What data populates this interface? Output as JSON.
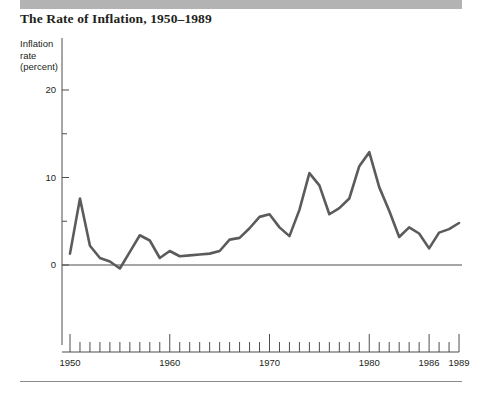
{
  "figure": {
    "title": "The Rate of Inflation, 1950–1989",
    "y_axis_caption_line1": "Inflation",
    "y_axis_caption_line2": "rate",
    "y_axis_caption_line3": "(percent)",
    "line_color": "#5b5b5b",
    "axis_color": "#4d4d4d",
    "band_color": "#b3b3b3",
    "text_color": "#231f20"
  },
  "chart_data": {
    "type": "line",
    "title": "The Rate of Inflation, 1950–1989",
    "xlabel": "",
    "ylabel": "Inflation rate (percent)",
    "xlim": [
      1949,
      1990
    ],
    "ylim": [
      -6,
      23
    ],
    "grid": false,
    "legend": null,
    "y_major_ticks": [
      0,
      10,
      20
    ],
    "y_minor_ticks": [
      5,
      15
    ],
    "y_tick_labels": [
      "0",
      "10",
      "20"
    ],
    "x_tick_labels": [
      "1950",
      "1960",
      "1970",
      "1980",
      "1986",
      "1989"
    ],
    "x_labeled_years": [
      1950,
      1960,
      1970,
      1980,
      1986,
      1989
    ],
    "x_tick_years": [
      1950,
      1951,
      1952,
      1953,
      1954,
      1955,
      1956,
      1957,
      1958,
      1959,
      1960,
      1961,
      1962,
      1963,
      1964,
      1965,
      1966,
      1967,
      1968,
      1969,
      1970,
      1971,
      1972,
      1973,
      1974,
      1975,
      1976,
      1977,
      1978,
      1979,
      1980,
      1981,
      1982,
      1983,
      1984,
      1985,
      1986,
      1987,
      1988,
      1989
    ],
    "series": [
      {
        "name": "Inflation rate",
        "x": [
          1950,
          1951,
          1952,
          1953,
          1954,
          1955,
          1956,
          1957,
          1958,
          1959,
          1960,
          1961,
          1962,
          1963,
          1964,
          1965,
          1966,
          1967,
          1968,
          1969,
          1970,
          1971,
          1972,
          1973,
          1974,
          1975,
          1976,
          1977,
          1978,
          1979,
          1980,
          1981,
          1982,
          1983,
          1984,
          1985,
          1986,
          1987,
          1988,
          1989
        ],
        "values": [
          1.3,
          7.6,
          2.2,
          0.8,
          0.4,
          -0.4,
          1.5,
          3.4,
          2.8,
          0.8,
          1.6,
          1.0,
          1.1,
          1.2,
          1.3,
          1.6,
          2.9,
          3.1,
          4.2,
          5.5,
          5.8,
          4.3,
          3.3,
          6.3,
          10.5,
          9.1,
          5.8,
          6.5,
          7.6,
          11.3,
          12.9,
          8.9,
          6.2,
          3.2,
          4.3,
          3.6,
          1.9,
          3.7,
          4.1,
          4.8
        ]
      }
    ]
  }
}
